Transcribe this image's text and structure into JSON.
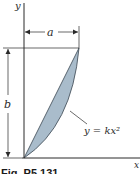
{
  "figure": {
    "caption": "Fig. P5.131",
    "axes": {
      "x_label": "x",
      "y_label": "y"
    },
    "dimensions": {
      "width_label": "a",
      "height_label": "b"
    },
    "curve": {
      "equation": "y = kx²"
    },
    "colors": {
      "fill": "#a9bccb",
      "stroke": "#2f3a44",
      "line": "#2a2a2a"
    }
  }
}
